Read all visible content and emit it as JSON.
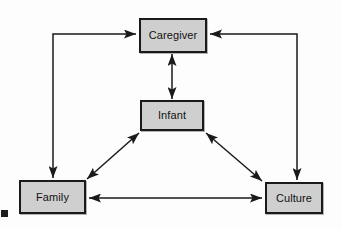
{
  "diagram": {
    "type": "node-link-diagram",
    "colors": {
      "node_fill": "#cfcfcf",
      "node_border": "#1a1a1a",
      "connector": "#1a1a1a",
      "background": "#fdfdfd"
    },
    "nodes": [
      {
        "id": "caregiver",
        "label": "Caregiver"
      },
      {
        "id": "infant",
        "label": "Infant"
      },
      {
        "id": "family",
        "label": "Family"
      },
      {
        "id": "culture",
        "label": "Culture"
      }
    ],
    "connections": [
      {
        "id": "caregiver-infant",
        "from": "Caregiver",
        "to": "Infant",
        "style": "straight-vertical",
        "arrowheads": "both"
      },
      {
        "id": "infant-family",
        "from": "Infant",
        "to": "Family",
        "style": "diagonal",
        "arrowheads": "both"
      },
      {
        "id": "infant-culture",
        "from": "Infant",
        "to": "Culture",
        "style": "diagonal",
        "arrowheads": "both"
      },
      {
        "id": "family-culture",
        "from": "Family",
        "to": "Culture",
        "style": "straight-horizontal",
        "arrowheads": "both"
      },
      {
        "id": "family-caregiver",
        "from": "Family",
        "to": "Caregiver",
        "style": "elbow-left",
        "arrowheads": "both"
      },
      {
        "id": "culture-caregiver",
        "from": "Culture",
        "to": "Caregiver",
        "style": "elbow-right",
        "arrowheads": "both"
      }
    ],
    "marks": [
      {
        "id": "corner-artifact",
        "label": ""
      }
    ]
  }
}
